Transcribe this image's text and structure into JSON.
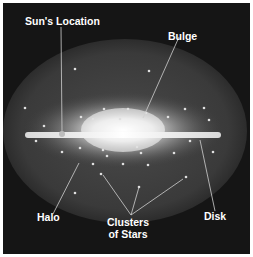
{
  "diagram": {
    "labels": {
      "sun_location": "Sun's Location",
      "bulge": "Bulge",
      "halo": "Halo",
      "clusters_line1": "Clusters",
      "clusters_line2": "of Stars",
      "disk": "Disk"
    },
    "colors": {
      "background": "#151515",
      "halo": "#3a3a3a",
      "bulge_glow": "#ffffff",
      "disk": "#f2f2f2",
      "leader_lines": "#cfcfcf",
      "star_clusters": "#e0e0e0"
    }
  }
}
